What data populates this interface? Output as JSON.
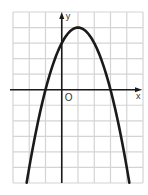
{
  "chart_data": {
    "type": "line",
    "title": "",
    "xlabel": "x",
    "ylabel": "y",
    "origin_label": "O",
    "function": "y = -x^2 + 2x + 3",
    "xlim": [
      -3,
      5
    ],
    "ylim": [
      -6,
      5
    ],
    "grid": true,
    "tick_labels": false,
    "key_points": {
      "vertex": [
        1,
        4
      ],
      "y_intercept": [
        0,
        3
      ],
      "x_intercepts": [
        [
          -1,
          0
        ],
        [
          3,
          0
        ]
      ]
    },
    "series": [
      {
        "name": "parabola",
        "x": [
          -2.16,
          -2,
          -1.5,
          -1,
          -0.5,
          0,
          0.5,
          1,
          1.5,
          2,
          2.5,
          3,
          3.5,
          4,
          4.16
        ],
        "y": [
          -6,
          -5,
          -2.25,
          0,
          1.75,
          3,
          3.75,
          4,
          3.75,
          3,
          1.75,
          0,
          -2.25,
          -5,
          -6
        ]
      }
    ],
    "colors": {
      "curve": "#1a1a1a",
      "axes": "#1a1a1a",
      "grid": "#d4d4d4"
    }
  }
}
